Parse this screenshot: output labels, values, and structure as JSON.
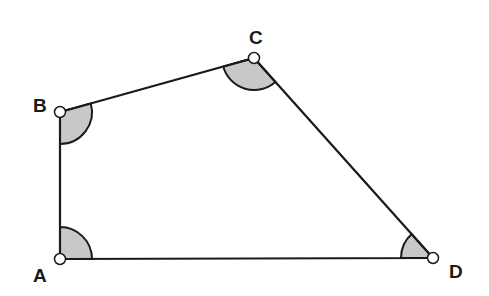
{
  "diagram": {
    "type": "quadrilateral",
    "colors": {
      "stroke": "#1a1a1a",
      "angle_fill": "#c8c8c8",
      "vertex_fill": "#ffffff"
    },
    "vertices": [
      {
        "label": "A",
        "x": 60,
        "y": 259
      },
      {
        "label": "B",
        "x": 60,
        "y": 112
      },
      {
        "label": "C",
        "x": 254,
        "y": 58
      },
      {
        "label": "D",
        "x": 433,
        "y": 258
      }
    ],
    "edges": [
      [
        "A",
        "B"
      ],
      [
        "B",
        "C"
      ],
      [
        "C",
        "D"
      ],
      [
        "D",
        "A"
      ]
    ],
    "marked_angles": [
      "A",
      "B",
      "C",
      "D"
    ]
  }
}
